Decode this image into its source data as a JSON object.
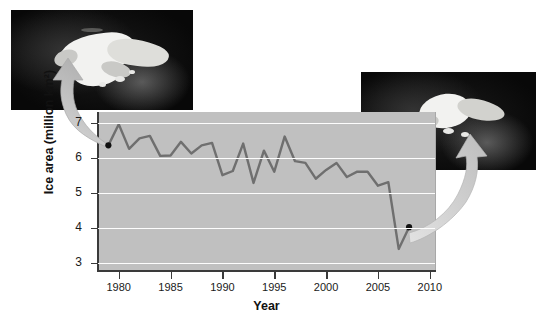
{
  "figure": {
    "background_color": "#ffffff"
  },
  "chart_data": {
    "type": "line",
    "title": "",
    "xlabel": "Year",
    "ylabel": "Ice area (million km²)",
    "xlim": [
      1978,
      2010.5
    ],
    "ylim": [
      2.8,
      7.3
    ],
    "xticks": [
      1980,
      1985,
      1990,
      1995,
      2000,
      2005,
      2010
    ],
    "yticks": [
      3,
      4,
      5,
      6,
      7
    ],
    "grid": "horizontal",
    "legend": "none",
    "line_color": "#6f6f6f",
    "plot_background": "#c0c0c0",
    "gridline_color": "#fdfdfd",
    "marker_color": "#111111",
    "x": [
      1979,
      1980,
      1981,
      1982,
      1983,
      1984,
      1985,
      1986,
      1987,
      1988,
      1989,
      1990,
      1991,
      1992,
      1993,
      1994,
      1995,
      1996,
      1997,
      1998,
      1999,
      2000,
      2001,
      2002,
      2003,
      2004,
      2005,
      2006,
      2007,
      2008
    ],
    "values": [
      6.35,
      6.95,
      6.25,
      6.55,
      6.62,
      6.05,
      6.06,
      6.45,
      6.12,
      6.35,
      6.42,
      5.5,
      5.62,
      6.4,
      5.28,
      6.2,
      5.6,
      6.6,
      5.9,
      5.85,
      5.4,
      5.65,
      5.85,
      5.45,
      5.6,
      5.6,
      5.2,
      5.3,
      3.4,
      4.02
    ],
    "xtick_labels": [
      "1980",
      "1985",
      "1990",
      "1995",
      "2000",
      "2005",
      "2010"
    ],
    "ytick_labels": [
      "3",
      "4",
      "5",
      "6",
      "7"
    ],
    "annotations": [
      {
        "name": "callout-1979",
        "point_year": 1979,
        "point_value": 6.35,
        "marker": "filled-circle",
        "arrow_direction": "up-left",
        "target": "satellite-image-left"
      },
      {
        "name": "callout-2008",
        "point_year": 2008,
        "point_value": 4.02,
        "marker": "filled-circle",
        "arrow_direction": "up-right",
        "target": "satellite-image-right"
      }
    ]
  },
  "images": {
    "left": {
      "label": "satellite-image-left",
      "description": "Satellite view of Arctic sea ice at large extent",
      "frame_color": "#070707"
    },
    "right": {
      "label": "satellite-image-right",
      "description": "Satellite view of Arctic sea ice at reduced extent",
      "frame_color": "#070707"
    }
  },
  "arrows": {
    "left": {
      "name": "arrow-to-left-image",
      "color": "#b9b9b9"
    },
    "right": {
      "name": "arrow-to-right-image",
      "color": "#c6c6c6"
    }
  }
}
